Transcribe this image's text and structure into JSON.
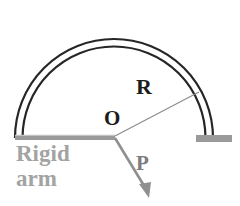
{
  "figure": {
    "background_color": "#ffffff",
    "width": 240,
    "height": 206
  },
  "labels": {
    "radius": "R",
    "origin": "O",
    "force": "P",
    "support_line1": "Rigid",
    "support_line2": "arm"
  },
  "colors": {
    "arch_stroke": "#262626",
    "arch_fill": "#ffffff",
    "rigid_arm": "#9a9a9a",
    "base_block": "#9a9a9a",
    "radius_line": "#8a8a8a",
    "force_arrow": "#8f8f8f",
    "label_dark": "#1c1c1c",
    "label_gray": "#a3a3a3",
    "force_label": "#7d7d7d"
  },
  "geometry": {
    "center": {
      "x": 114,
      "y": 138
    },
    "radius": 97,
    "arch_inner_radius": 92,
    "arch_start_angle_deg": 180,
    "arch_end_angle_deg": 0,
    "radius_line_end": {
      "x": 199,
      "y": 92
    },
    "radius_line_angle_deg": 28,
    "force_arrow_end": {
      "x": 149,
      "y": 197
    },
    "force_arrow_angle_deg": -59,
    "rigid_arm": {
      "x1": 15,
      "y1": 138,
      "x2": 114,
      "y2": 138,
      "thickness": 5
    },
    "base_block": {
      "x": 196,
      "y": 135,
      "width": 36,
      "height": 7
    }
  }
}
